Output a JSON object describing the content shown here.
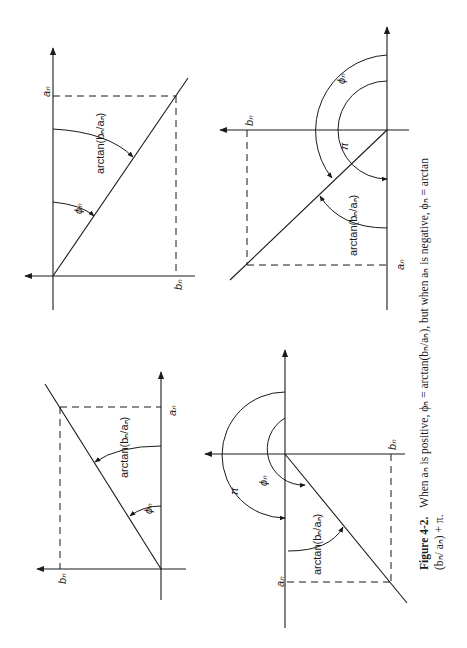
{
  "figure": {
    "orientation": "rotated 90 degrees counter-clockwise",
    "caption": {
      "label": "Figure 4-2.",
      "line1": "When aₙ is positive, ϕₙ = arctan(bₙ/aₙ), but when aₙ is negative, ϕₙ = arctan",
      "line2": "(bₙ/ aₙ) + π."
    },
    "panels": [
      {
        "id": "a-pos-b-pos",
        "labels": {
          "a_axis": "aₙ",
          "b_axis": "bₙ",
          "phi": "ϕₙ",
          "arctan": "arctan(bₙ/aₙ)"
        }
      },
      {
        "id": "a-neg-b-pos",
        "labels": {
          "a_axis": "aₙ",
          "b_axis": "bₙ",
          "phi": "ϕₙ",
          "pi": "π",
          "arctan": "arctan(bₙ/aₙ)"
        }
      },
      {
        "id": "a-pos-b-neg",
        "labels": {
          "a_axis": "aₙ",
          "b_axis": "bₙ",
          "phi": "ϕₙ",
          "arctan": "arctan(bₙ/aₙ)"
        }
      },
      {
        "id": "a-neg-b-neg",
        "labels": {
          "a_axis": "aₙ",
          "b_axis": "bₙ",
          "phi": "ϕₙ",
          "pi": "π",
          "arctan": "arctan(bₙ/aₙ)"
        }
      }
    ]
  }
}
